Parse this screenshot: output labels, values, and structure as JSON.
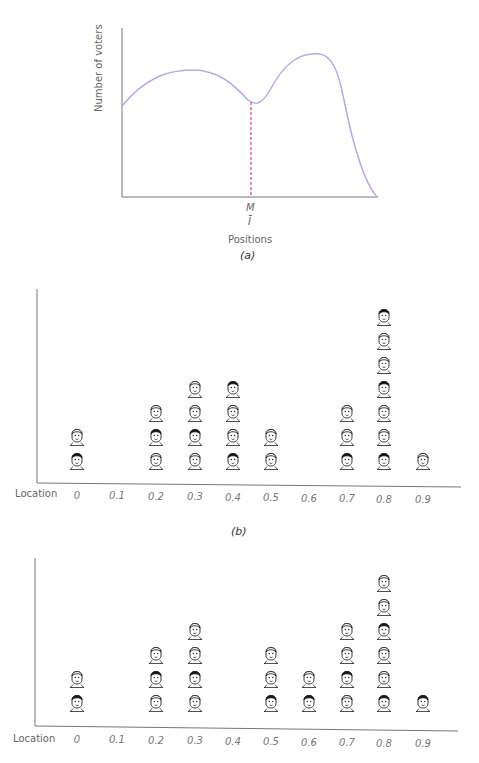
{
  "chart_data": [
    {
      "panel": "a",
      "type": "line",
      "title": "",
      "xlabel": "Positions",
      "ylabel": "Number of voters",
      "annotations": [
        "M",
        "Ī"
      ],
      "median_marker": {
        "label": "M",
        "sublabel": "Ī",
        "style": "red dashed vertical line",
        "x_fraction": 0.51
      },
      "description": "Bimodal distribution of voters across positions; left hump lower, right hump higher; median M at the dip between humps",
      "curve_points": [
        {
          "x": 0.0,
          "y": 0.54
        },
        {
          "x": 0.27,
          "y": 0.75
        },
        {
          "x": 0.51,
          "y": 0.56
        },
        {
          "x": 0.79,
          "y": 0.84
        },
        {
          "x": 1.0,
          "y": 0.0
        }
      ],
      "grid": false,
      "caption": "(a)"
    },
    {
      "panel": "b",
      "type": "bar",
      "description": "Pictogram: each face icon represents one voter at a location",
      "xlabel": "Location",
      "categories": [
        "0",
        "0.1",
        "0.2",
        "0.3",
        "0.4",
        "0.5",
        "0.6",
        "0.7",
        "0.8",
        "0.9"
      ],
      "values": [
        2,
        0,
        3,
        4,
        4,
        2,
        0,
        3,
        7,
        1
      ],
      "caption": "(b)"
    },
    {
      "panel": "c",
      "type": "bar",
      "description": "Pictogram: each face icon represents one voter at a location",
      "xlabel": "Location",
      "categories": [
        "0",
        "0.1",
        "0.2",
        "0.3",
        "0.4",
        "0.5",
        "0.6",
        "0.7",
        "0.8",
        "0.9"
      ],
      "values": [
        2,
        0,
        3,
        4,
        0,
        3,
        2,
        4,
        6,
        1
      ],
      "caption": ""
    }
  ],
  "panel_a": {
    "ylabel": "Number of voters",
    "xlabel": "Positions",
    "median_label": "M",
    "median_sublabel": "Ī",
    "caption": "(a)",
    "colors": {
      "curve": "#b4aee0",
      "median_line": "#e0506a",
      "axis": "#777777"
    }
  },
  "panel_b": {
    "axis_label": "Location",
    "ticks": [
      "0",
      "0.1",
      "0.2",
      "0.3",
      "0.4",
      "0.5",
      "0.6",
      "0.7",
      "0.8",
      "0.9"
    ],
    "caption": "(b)"
  },
  "panel_c": {
    "axis_label": "Location",
    "ticks": [
      "0",
      "0.1",
      "0.2",
      "0.3",
      "0.4",
      "0.5",
      "0.6",
      "0.7",
      "0.8",
      "0.9"
    ]
  },
  "icons": {
    "voter": "face-icon"
  }
}
